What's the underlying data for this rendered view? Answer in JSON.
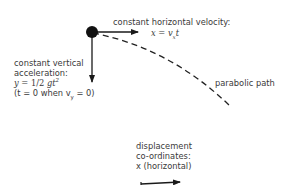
{
  "diagram": {
    "type": "projectile-motion",
    "nodes": [
      {
        "id": "projectile",
        "shape": "filled-circle",
        "label": ""
      }
    ],
    "labels": {
      "horizontal_title": "constant horizontal velocity:",
      "horizontal_eq_lhs": "x",
      "horizontal_eq_eq": " = ",
      "horizontal_eq_v": "v",
      "horizontal_eq_sub": "x",
      "horizontal_eq_t": "t",
      "vertical_title_1": "constant vertical",
      "vertical_title_2": "acceleration:",
      "vertical_eq_lhs": "y",
      "vertical_eq_mid": " = 1/2 ",
      "vertical_eq_g": "gt",
      "vertical_eq_sup": "2",
      "vertical_cond_1": "(t = 0 when v",
      "vertical_cond_sub": "y",
      "vertical_cond_2": " = 0)",
      "path_label": "parabolic path",
      "disp_1": "displacement",
      "disp_2": "co-ordinates:",
      "disp_3": "x (horizontal)"
    },
    "edges": [
      {
        "from": "projectile",
        "to": "horizontal-arrow-tip",
        "style": "solid-arrow",
        "label": "constant horizontal velocity"
      },
      {
        "from": "projectile",
        "to": "vertical-arrow-tip",
        "style": "solid-arrow",
        "label": "constant vertical acceleration"
      },
      {
        "from": "projectile",
        "to": "path-end",
        "style": "dashed-curve",
        "label": "parabolic path"
      }
    ],
    "colors": {
      "ink": "#1a1a1a",
      "text": "#3a3a3a",
      "background": "#ffffff"
    }
  }
}
